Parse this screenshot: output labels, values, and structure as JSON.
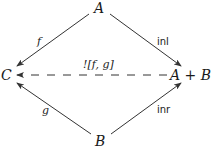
{
  "diagram": {
    "type": "commutative-diagram",
    "nodes": {
      "top": "A",
      "left": "C",
      "right": "A + B",
      "bottom": "B"
    },
    "edges": [
      {
        "from": "A",
        "to": "C",
        "label": "f",
        "style": "solid"
      },
      {
        "from": "A",
        "to": "A + B",
        "label": "inl",
        "style": "solid"
      },
      {
        "from": "B",
        "to": "C",
        "label": "g",
        "style": "solid"
      },
      {
        "from": "B",
        "to": "A + B",
        "label": "inr",
        "style": "solid"
      },
      {
        "from": "A + B",
        "to": "C",
        "label": "![f, g]",
        "style": "dashed"
      }
    ],
    "colors": {
      "stroke": "#333333",
      "text": "#1a1a1a",
      "background": "#ffffff"
    }
  }
}
